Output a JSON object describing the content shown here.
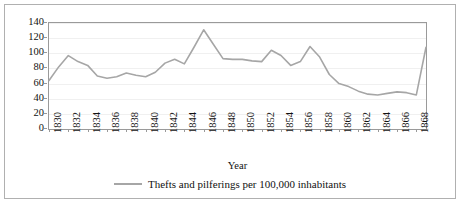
{
  "chart_data": {
    "type": "line",
    "title": "",
    "xlabel": "Year",
    "ylabel": "Crimes per 100,000",
    "xlim": [
      1830,
      1869
    ],
    "ylim": [
      0,
      140
    ],
    "grid": true,
    "legend_position": "bottom-center",
    "line_color": "#a6a6a6",
    "x_tick_labels": [
      "1830",
      "1832",
      "1834",
      "1836",
      "1838",
      "1840",
      "1842",
      "1844",
      "1846",
      "1848",
      "1850",
      "1852",
      "1854",
      "1856",
      "1858",
      "1860",
      "1862",
      "1864",
      "1866",
      "1868"
    ],
    "y_tick_labels": [
      "0",
      "20",
      "40",
      "60",
      "80",
      "100",
      "120",
      "140"
    ],
    "y_ticks": [
      0,
      20,
      40,
      60,
      80,
      100,
      120,
      140
    ],
    "series": [
      {
        "name": "Thefts and pilferings per 100,000 inhabitants",
        "x": [
          1830,
          1831,
          1832,
          1833,
          1834,
          1835,
          1836,
          1837,
          1838,
          1839,
          1840,
          1841,
          1842,
          1843,
          1844,
          1845,
          1846,
          1847,
          1848,
          1849,
          1850,
          1851,
          1852,
          1853,
          1854,
          1855,
          1856,
          1857,
          1858,
          1859,
          1860,
          1861,
          1862,
          1863,
          1864,
          1865,
          1866,
          1867,
          1868,
          1869
        ],
        "values": [
          64,
          82,
          97,
          89,
          84,
          70,
          67,
          69,
          74,
          71,
          69,
          75,
          87,
          92,
          86,
          108,
          131,
          112,
          93,
          92,
          92,
          90,
          89,
          104,
          97,
          84,
          89,
          109,
          95,
          72,
          60,
          56,
          50,
          46,
          45,
          47,
          49,
          48,
          45,
          108
        ]
      }
    ]
  },
  "legend": {
    "label": "Thefts and pilferings per 100,000 inhabitants",
    "swatch_name": "line-swatch"
  },
  "axes": {
    "x_title": "Year",
    "y_title": "Crimes per 100,000"
  }
}
